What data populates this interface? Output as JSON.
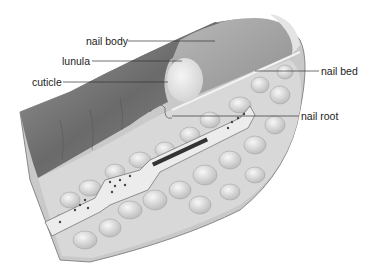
{
  "diagram": {
    "labels": [
      {
        "id": "nail-body",
        "text": "nail body",
        "x": 86,
        "y": 35,
        "line": [
          128,
          41,
          215,
          41
        ],
        "side": "left"
      },
      {
        "id": "lunula",
        "text": "lunula",
        "x": 62,
        "y": 55,
        "line": [
          92,
          61,
          182,
          61
        ],
        "side": "left"
      },
      {
        "id": "cuticle",
        "text": "cuticle",
        "x": 32,
        "y": 76,
        "line": [
          63,
          82,
          168,
          82
        ],
        "side": "left"
      },
      {
        "id": "nail-bed",
        "text": "nail bed",
        "x": 321,
        "y": 65,
        "line": [
          255,
          71,
          319,
          71
        ],
        "side": "right"
      },
      {
        "id": "nail-root",
        "text": "nail root",
        "x": 301,
        "y": 110,
        "line": [
          172,
          116,
          299,
          116
        ],
        "side": "right"
      }
    ]
  },
  "colors": {
    "background": "#ffffff",
    "skin_dark": "#6e6e6e",
    "skin_light": "#b5b5b5",
    "nail": "#a9a9a9",
    "lunula": "#e6e6e6",
    "fat": "#d9d9d9",
    "bone": "#ececec",
    "line": "#333333"
  }
}
